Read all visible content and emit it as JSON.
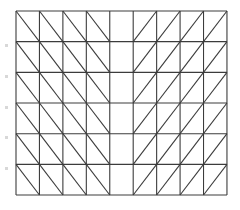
{
  "diagram": {
    "type": "triangulated-grid-mesh",
    "cols": 9,
    "rows": 6,
    "origin": [
      16,
      11
    ],
    "cell_width": 23.44,
    "cell_height": 30.67,
    "line_color": "#3c3c3c",
    "line_width": 1.1,
    "background": "#ffffff",
    "column_diagonals": [
      "\\",
      "\\",
      "\\",
      "\\",
      "none",
      "/",
      "/",
      "/",
      "/"
    ],
    "margin_marks_y": [
      44,
      75,
      106,
      136,
      167
    ]
  }
}
